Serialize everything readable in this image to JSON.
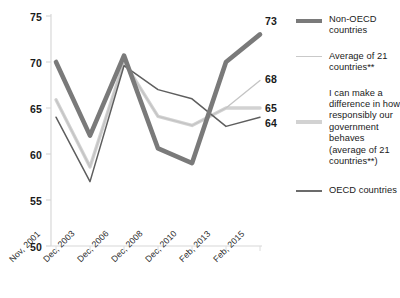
{
  "chart_data": {
    "type": "line",
    "title": "",
    "xlabel": "",
    "ylabel": "",
    "ylim": [
      50,
      75
    ],
    "yticks": [
      50,
      55,
      60,
      65,
      70,
      75
    ],
    "grid": false,
    "legend_position": "right",
    "categories": [
      "Nov, 2001",
      "Dec, 2003",
      "Dec, 2006",
      "Dec, 2008",
      "Dec, 2010",
      "Feb, 2013",
      "Feb, 2015"
    ],
    "series": [
      {
        "name": "Non-OECD countries",
        "color": "#7a7a7a",
        "width": 4.6,
        "end_label": "73",
        "values": [
          70,
          62,
          70.7,
          60.6,
          59,
          70,
          73
        ]
      },
      {
        "name": "Average of 21 countries**",
        "color": "#c4c4c4",
        "width": 1.3,
        "end_label": "68",
        "values": [
          65.9,
          58.6,
          70,
          64.1,
          63.1,
          65,
          68
        ]
      },
      {
        "name": "I can make a difference in how responsibly our government behaves (average of 21 countries**)",
        "color": "#d2d2d2",
        "width": 3.4,
        "end_label": "65",
        "values": [
          65.9,
          58.6,
          70,
          64.1,
          63.1,
          65,
          65
        ]
      },
      {
        "name": "OECD countries",
        "color": "#5e5e5e",
        "width": 1.5,
        "end_label": "64",
        "values": [
          64,
          57,
          69.6,
          67,
          66,
          63,
          64
        ]
      }
    ]
  },
  "legend": {
    "items": [
      {
        "label": "Non-OECD countries",
        "swatch": "thick-gray-line-swatch"
      },
      {
        "label": "Average of 21 countries**",
        "swatch": "thin-light-gray-line-swatch"
      },
      {
        "label": "I can make a difference in how responsibly our government behaves (average of 21 countries**)",
        "swatch": "thick-light-gray-line-swatch"
      },
      {
        "label": "OECD countries",
        "swatch": "thin-dark-gray-line-swatch"
      }
    ]
  },
  "axis": {
    "y_labels": [
      "75",
      "70",
      "65",
      "60",
      "55",
      "50"
    ],
    "x_labels": [
      "Nov, 2001",
      "Dec, 2003",
      "Dec, 2006",
      "Dec, 2008",
      "Dec, 2010",
      "Feb, 2013",
      "Feb, 2015"
    ]
  },
  "end_labels": [
    "73",
    "68",
    "65",
    "64"
  ]
}
